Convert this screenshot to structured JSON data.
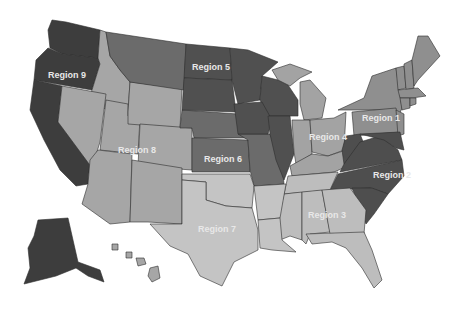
{
  "map": {
    "title": "United States regions map",
    "background": "#ffffff",
    "regions": [
      {
        "id": "region-1",
        "label": "Region 1",
        "color": "#8f8f8f",
        "label_x": 362,
        "label_y": 121,
        "states": [
          "ME",
          "NH",
          "VT",
          "MA",
          "RI",
          "CT",
          "NY",
          "PA",
          "NJ"
        ]
      },
      {
        "id": "region-2",
        "label": "Region 2",
        "color": "#4e4e4e",
        "label_x": 373,
        "label_y": 178,
        "states": [
          "WV",
          "VA",
          "MD",
          "DE",
          "DC",
          "NC",
          "SC"
        ]
      },
      {
        "id": "region-3",
        "label": "Region 3",
        "color": "#bdbdbd",
        "label_x": 308,
        "label_y": 218,
        "states": [
          "TN",
          "MS",
          "AL",
          "GA",
          "FL"
        ]
      },
      {
        "id": "region-4",
        "label": "Region 4",
        "color": "#a3a3a3",
        "label_x": 309,
        "label_y": 140,
        "states": [
          "MI",
          "IN",
          "OH",
          "KY"
        ]
      },
      {
        "id": "region-5",
        "label": "Region 5",
        "color": "#505050",
        "label_x": 192,
        "label_y": 70,
        "states": [
          "ND",
          "SD",
          "MN",
          "WI",
          "IA",
          "IL"
        ]
      },
      {
        "id": "region-6",
        "label": "Region 6",
        "color": "#6b6b6b",
        "label_x": 204,
        "label_y": 162,
        "states": [
          "NE",
          "KS",
          "MO",
          "MT"
        ]
      },
      {
        "id": "region-7",
        "label": "Region 7",
        "color": "#c4c4c4",
        "label_x": 198,
        "label_y": 232,
        "states": [
          "OK",
          "TX",
          "AR",
          "LA"
        ]
      },
      {
        "id": "region-8",
        "label": "Region 8",
        "color": "#a6a6a6",
        "label_x": 118,
        "label_y": 153,
        "states": [
          "ID",
          "WY",
          "NV",
          "UT",
          "CO",
          "AZ",
          "NM",
          "HI"
        ]
      },
      {
        "id": "region-9",
        "label": "Region 9",
        "color": "#3d3d3d",
        "label_x": 48,
        "label_y": 78,
        "states": [
          "WA",
          "OR",
          "CA",
          "AK"
        ]
      }
    ]
  }
}
